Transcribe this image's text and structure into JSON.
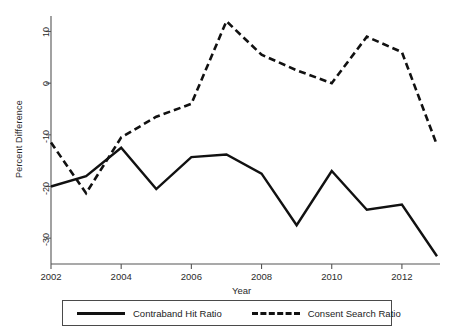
{
  "chart_data": {
    "type": "line",
    "title": "",
    "subtitle": "",
    "xlabel": "Year",
    "ylabel": "Percent Difference",
    "x": [
      2002,
      2003,
      2004,
      2005,
      2006,
      2007,
      2008,
      2009,
      2010,
      2011,
      2012,
      2013
    ],
    "xlim": [
      2002,
      2013
    ],
    "ylim": [
      -35,
      13
    ],
    "xticks": [
      2002,
      2004,
      2006,
      2008,
      2010,
      2012
    ],
    "xtick_labels": [
      "2002",
      "2004",
      "2006",
      "2008",
      "2010",
      "2012"
    ],
    "yticks": [
      10,
      0,
      -10,
      -20,
      -30
    ],
    "ytick_labels": [
      "10",
      "0",
      "-10",
      "-20",
      "-30"
    ],
    "grid": false,
    "legend_position": "bottom",
    "series": [
      {
        "name": "Contraband Hit Ratio",
        "style": "solid",
        "color": "#111111",
        "values": [
          -20,
          -18,
          -12.5,
          -20.5,
          -14.3,
          -13.8,
          -17.5,
          -27.5,
          -17,
          -24.5,
          -23.5,
          -33.5
        ]
      },
      {
        "name": "Consent Search Ratio",
        "style": "dashed",
        "color": "#111111",
        "values": [
          -11.5,
          -21.3,
          -10.5,
          -6.5,
          -4,
          12,
          5.5,
          2.5,
          0,
          9,
          6,
          -12
        ]
      }
    ]
  },
  "legend": {
    "entries": [
      {
        "label": "Contraband Hit Ratio",
        "style": "solid"
      },
      {
        "label": "Consent Search Ratio",
        "style": "dashed"
      }
    ]
  }
}
